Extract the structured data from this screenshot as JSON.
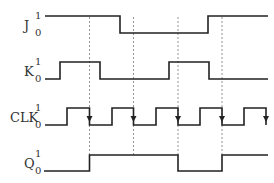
{
  "diagram": {
    "signals": [
      {
        "name": "J",
        "high_label": "1",
        "low_label": "0"
      },
      {
        "name": "K",
        "high_label": "1",
        "low_label": "0"
      },
      {
        "name": "CLK",
        "high_label": "1",
        "low_label": "0"
      },
      {
        "name": "Q",
        "high_label": "1",
        "low_label": "0"
      }
    ],
    "clock_trigger": "falling-edge",
    "waveforms": {
      "J": [
        1,
        1,
        0,
        0,
        1
      ],
      "K": [
        0,
        1,
        0,
        1,
        0
      ],
      "CLK_pulses": 5,
      "Q": [
        0,
        1,
        1,
        0,
        1
      ]
    },
    "colors": {
      "line": "#222222",
      "dash": "#888888",
      "text": "#333333",
      "background": "#ffffff"
    }
  }
}
